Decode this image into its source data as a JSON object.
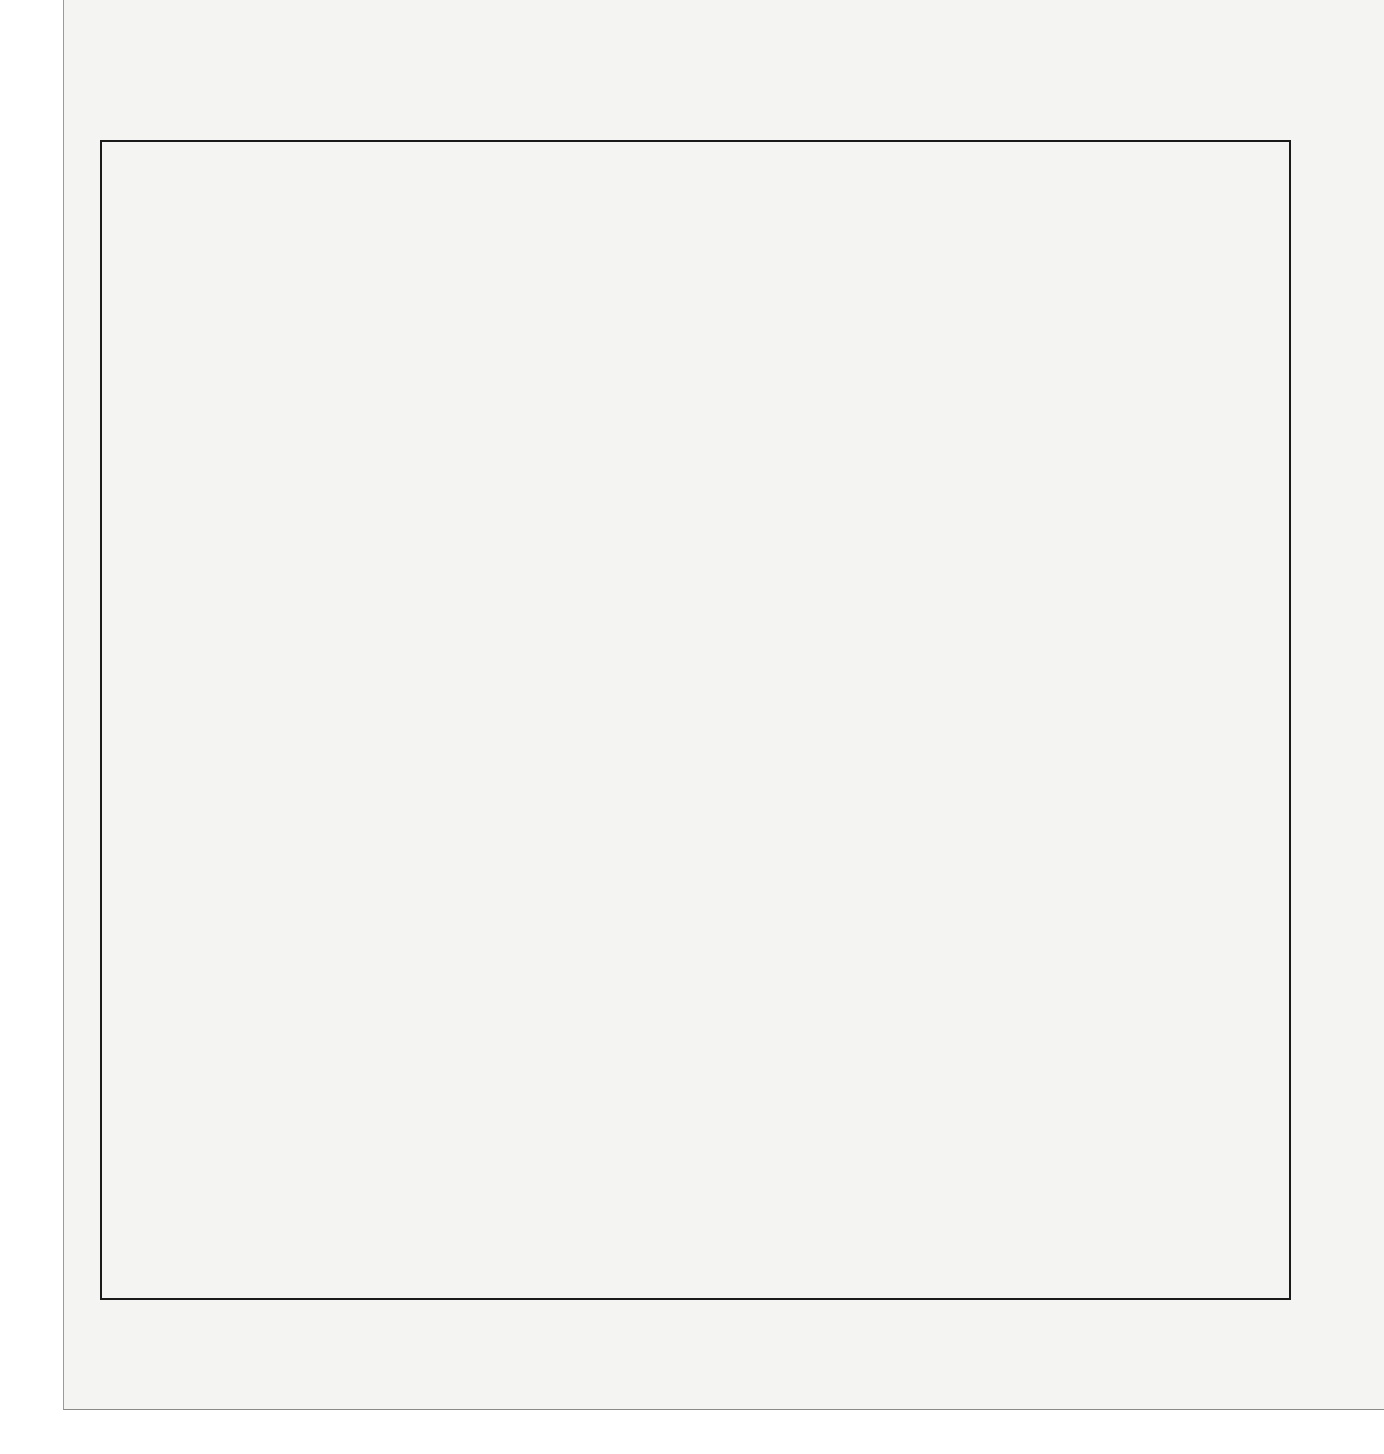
{
  "chart_data": {
    "type": "bar",
    "orientation": "horizontal-range",
    "title": "",
    "xlabel": "Numbers of Nucleotides",
    "ylabel": "",
    "xscale": "log10",
    "xlim": [
      1000,
      10000000000000
    ],
    "x_ticks": [
      "10^3",
      "10^4",
      "10^5",
      "10^6",
      "10^7",
      "10^8",
      "10^9",
      "10^10",
      "10^11",
      "10^12",
      "10^13"
    ],
    "x_tick_exponents": [
      "3",
      "4",
      "5",
      "6",
      "7",
      "8",
      "9",
      "10",
      "11",
      "12",
      "13"
    ],
    "grid": false,
    "legend": null,
    "bar_color": "#8d8d8d",
    "series": [
      {
        "label": "Psilopsida",
        "log_min": 11.42,
        "log_max": 11.8
      },
      {
        "label": "Dipnoa (lungfishes)",
        "log_min": 11.02,
        "log_max": 11.07
      },
      {
        "label": "Sphenopsida (horsetails)",
        "log_min": 10.86,
        "log_max": 10.92
      },
      {
        "label": "Apoda (caecilians)",
        "log_min": 10.68,
        "log_max": 10.69
      },
      {
        "label": "Urodela (salamanders)",
        "log_min": 10.33,
        "log_max": 11.31
      },
      {
        "label": "Pteropsida (ferns)",
        "log_min": 10.09,
        "log_max": 11.48
      },
      {
        "label": "Gymnospermae",
        "log_min": 9.96,
        "log_max": 11.16
      },
      {
        "label": "Prototheria (monotreme mammals)",
        "log_min": 9.78,
        "log_max": 9.81
      },
      {
        "label": "Lycopsida (club-mosses)",
        "log_min": 9.74,
        "log_max": 10.56
      },
      {
        "label": "Eutheria (placental mammals)",
        "log_min": 9.75,
        "log_max": 10.03
      },
      {
        "label": "Chondrostei (fishes)",
        "log_min": 9.53,
        "log_max": 9.73
      },
      {
        "label": "Metatheria (marsupial mammals)",
        "log_min": 9.52,
        "log_max": 10.0
      },
      {
        "label": "Chondrichthyes (sharks, rays, chimaeras)",
        "log_min": 9.52,
        "log_max": 9.88
      },
      {
        "label": "Reptilia (reptiles)",
        "log_min": 9.48,
        "log_max": 9.77
      },
      {
        "label": "Annelida (segmented worms)",
        "log_min": 9.47,
        "log_max": 9.48
      },
      {
        "label": "Holostei (fishes)",
        "log_min": 9.38,
        "log_max": 9.48
      },
      {
        "label": "Agnatha (lampreys and hagfishes)",
        "log_min": 9.39,
        "log_max": 9.73
      },
      {
        "label": "Anura (frogs and toads)",
        "log_min": 9.36,
        "log_max": 10.36
      },
      {
        "label": "Angiospermae",
        "log_min": 9.35,
        "log_max": 11.56
      },
      {
        "label": "Aves (birds)",
        "log_min": 9.26,
        "log_max": 9.51
      },
      {
        "label": "Echinodermata",
        "log_min": 9.15,
        "log_max": 9.33
      },
      {
        "label": "Cephalochordata (amphioxus)",
        "log_min": 9.03,
        "log_max": 9.04
      },
      {
        "label": "Mollusca",
        "log_min": 9.03,
        "log_max": 10.04
      },
      {
        "label": "Bryophyta (mosses and liverworts)",
        "log_min": 9.0,
        "log_max": 9.98
      },
      {
        "label": "Nematoda (roundworms)",
        "log_min": 8.97,
        "log_max": 8.98
      },
      {
        "label": "Teleostei (fishes)",
        "log_min": 8.93,
        "log_max": 9.97
      },
      {
        "label": "Coelenterata",
        "log_min": 8.85,
        "log_max": 8.88
      },
      {
        "label": "Urochordata (tunicates)",
        "log_min": 8.54,
        "log_max": 8.58
      },
      {
        "label": "Arthropoda",
        "log_min": 8.27,
        "log_max": 10.21
      },
      {
        "label": "Protozoa",
        "log_min": 8.12,
        "log_max": 11.9
      },
      {
        "label": "Porifera (sponges)",
        "log_min": 8.08,
        "log_max": 8.13
      },
      {
        "label": "Algae (except blue-greens)",
        "log_min": 7.95,
        "log_max": 11.56
      },
      {
        "label": "Fungi",
        "log_min": 7.72,
        "log_max": 8.89
      },
      {
        "label": "Bacteria",
        "log_min": 6.13,
        "log_max": 7.78
      },
      {
        "label": "Double-stranded DNA viruses",
        "log_min": 4.09,
        "log_max": 5.75
      },
      {
        "label": "RNA and single-stranded DNA viruses",
        "log_min": 3.13,
        "log_max": 4.55
      }
    ],
    "annotations": [
      {
        "text": "Dipnoans, primitive amphibia and primitive vascular plants",
        "lines": [
          "Dipnoans, primitive amphibia and",
          "primitive vascular plants"
        ]
      },
      {
        "text": "Mostly intermediate to highly advanced vertebrates and vascular plants",
        "lines": [
          "Mostly intermediate",
          "to highly advanced",
          "vertebrates and vascular plants"
        ]
      },
      {
        "text": "Complex multicellular forms, no vertebrates (except teleostei) or vascular plants",
        "lines": [
          "Complex multicellular forms,",
          "no vertebrates (except teleostei)",
          "or vascular plants"
        ]
      },
      {
        "text": "Single-cell or primitive multicellular forms",
        "lines": [
          "Single-cell or",
          "primitive multicellular",
          "forms"
        ]
      },
      {
        "text": "Viruses and bacteria",
        "lines": [
          "Viruses and bacteria"
        ]
      }
    ]
  },
  "bars": [
    {
      "label": "Psilopsida",
      "x1": 1103,
      "x2": 1148,
      "y": 313
    },
    {
      "label": "Dipnoa (lungfishes)",
      "x1": 1056,
      "x2": 1061,
      "y": 340
    },
    {
      "label": "Sphenopsida (horsetails)",
      "x1": 1036,
      "x2": 1043,
      "y": 366
    },
    {
      "label": "Apoda (caecilians)",
      "x1": 1015,
      "x2": 1016,
      "y": 393
    },
    {
      "label": "Urodela (salamanders)",
      "x1": 973,
      "x2": 1090,
      "y": 419
    },
    {
      "label": "Pteropsida (ferns)",
      "x1": 945,
      "x2": 1110,
      "y": 445
    },
    {
      "label": "Gymnospermae",
      "x1": 929,
      "x2": 1072,
      "y": 472
    },
    {
      "label": "Prototheria (monotreme mammals)",
      "x1": 907,
      "x2": 911,
      "y": 500
    },
    {
      "label": "Lycopsida (club-mosses)",
      "x1": 903,
      "x2": 1000,
      "y": 526
    },
    {
      "label": "Eutheria (placental mammals)",
      "x1": 904,
      "x2": 937,
      "y": 553
    },
    {
      "label": "Chondrostei (fishes)",
      "x1": 878,
      "x2": 902,
      "y": 580
    },
    {
      "label": "Metatheria (marsupial mammals)",
      "x1": 876,
      "x2": 934,
      "y": 606
    },
    {
      "label": "Chondrichthyes (sharks, rays, chimaeras)",
      "x1": 876,
      "x2": 919,
      "y": 632
    },
    {
      "label": "Reptilia (reptiles)",
      "x1": 872,
      "x2": 906,
      "y": 659
    },
    {
      "label": "Annelida (segmented worms)",
      "x1": 871,
      "x2": 873,
      "y": 686
    },
    {
      "label": "Holostei (fishes)",
      "x1": 860,
      "x2": 872,
      "y": 713
    },
    {
      "label": "Agnatha (lampreys and hagfishes)",
      "x1": 861,
      "x2": 902,
      "y": 739
    },
    {
      "label": "Anura (frogs and toads)",
      "x1": 857,
      "x2": 976,
      "y": 765
    },
    {
      "label": "Angiospermae",
      "x1": 856,
      "x2": 1120,
      "y": 792
    },
    {
      "label": "Aves (birds)",
      "x1": 846,
      "x2": 875,
      "y": 819
    },
    {
      "label": "Echinodermata",
      "x1": 832,
      "x2": 854,
      "y": 846
    },
    {
      "label": "Cephalochordata (amphioxus)",
      "x1": 818,
      "x2": 820,
      "y": 873
    },
    {
      "label": "Mollusca",
      "x1": 818,
      "x2": 939,
      "y": 899
    },
    {
      "label": "Bryophyta (mosses and liverworts)",
      "x1": 814,
      "x2": 931,
      "y": 925
    },
    {
      "label": "Nematoda (roundworms)",
      "x1": 811,
      "x2": 813,
      "y": 953
    },
    {
      "label": "Teleostei (fishes)",
      "x1": 806,
      "x2": 930,
      "y": 979
    },
    {
      "label": "Coelenterata",
      "x1": 797,
      "x2": 800,
      "y": 1008
    },
    {
      "label": "Urochordata (tunicates)",
      "x1": 760,
      "x2": 765,
      "y": 1035
    },
    {
      "label": "Arthropoda",
      "x1": 728,
      "x2": 959,
      "y": 1062
    },
    {
      "label": "Protozoa",
      "x1": 710,
      "x2": 1160,
      "y": 1089
    },
    {
      "label": "Porifera (sponges)",
      "x1": 705,
      "x2": 711,
      "y": 1117
    },
    {
      "label": "Algae (except",
      "label2": "blue-greens)",
      "x1": 689,
      "x2": 1120,
      "y": 1143
    },
    {
      "label": "Fungi",
      "x1": 662,
      "x2": 801,
      "y": 1171
    },
    {
      "label": "Bacteria",
      "x1": 473,
      "x2": 669,
      "y": 1198
    },
    {
      "label": "Double-stranded DNA viruses",
      "x1": 230,
      "x2": 428,
      "y": 1226
    },
    {
      "label": "RNA and single-stranded DNA viruses",
      "x1": 116,
      "x2": 285,
      "y": 1253
    }
  ],
  "axis": {
    "tick_base": "10",
    "ticks": [
      {
        "exp": "3",
        "x": 100
      },
      {
        "exp": "4",
        "x": 219
      },
      {
        "exp": "5",
        "x": 338
      },
      {
        "exp": "6",
        "x": 457
      },
      {
        "exp": "7",
        "x": 576
      },
      {
        "exp": "8",
        "x": 695
      },
      {
        "exp": "9",
        "x": 814
      },
      {
        "exp": "10",
        "x": 934
      },
      {
        "exp": "11",
        "x": 1053
      },
      {
        "exp": "12",
        "x": 1172
      },
      {
        "exp": "13",
        "x": 1291
      }
    ],
    "xlabel": "Numbers of Nucleotides"
  },
  "groups": [
    {
      "lines": [
        "Dipnoans, primitive amphibia and",
        "primitive vascular plants"
      ],
      "cx": 1035,
      "top": 156,
      "bx1": 973,
      "bx2": 1104,
      "by": 210,
      "vtop": 222,
      "vbot1": 418,
      "vbot2": 312
    },
    {
      "lines": [
        "Mostly intermediate",
        "to highly advanced",
        "vertebrates and vascular plants"
      ],
      "cx": 889,
      "top": 252,
      "bx1": 847,
      "bx2": 945,
      "by": 335,
      "vtop": 347,
      "vbot1": 818,
      "vbot2": 444
    },
    {
      "lines": [
        "Complex multicellular forms,",
        "no vertebrates (except teleostei)",
        "or vascular plants"
      ],
      "cx": 773,
      "top": 383,
      "bx1": 725,
      "bx2": 832,
      "by": 465,
      "vtop": 477,
      "vbot1": 1060,
      "vbot2": 845
    },
    {
      "lines": [
        "Single-cell or",
        "primitive multicellular",
        "forms"
      ],
      "cx": 684,
      "top": 684,
      "bx1": 662,
      "bx2": 707,
      "by": 755,
      "vtop": 773,
      "vbot1": 1170,
      "vbot2": 1088
    },
    {
      "lines": [
        "Viruses and bacteria"
      ],
      "cx": 293,
      "top": 993,
      "bx1": 117,
      "bx2": 473,
      "by": 1038,
      "vtop": 1057,
      "vbot1": 1252,
      "vbot2": 1197
    }
  ]
}
